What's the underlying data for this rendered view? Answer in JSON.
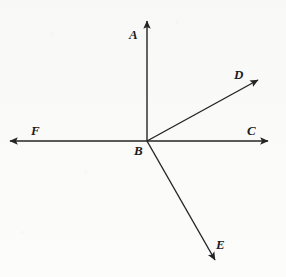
{
  "figure": {
    "kind": "ray-diagram",
    "caption": "",
    "stroke_color": "#242424",
    "label_color": "#1b1b1b",
    "background_color": "#fcfcfb",
    "stroke_width": 1.4,
    "width": 286,
    "height": 277
  },
  "chart_data": {
    "type": "diagram",
    "title": "",
    "subtitle": "",
    "xlabel": "",
    "ylabel": "",
    "vertex": {
      "label": "B",
      "x": 147,
      "y": 141
    },
    "rays": [
      {
        "label": "A",
        "from": [
          147,
          141
        ],
        "to": [
          147,
          21
        ],
        "direction": "up",
        "angle_deg": 90,
        "arrow": true
      },
      {
        "label": "D",
        "from": [
          147,
          141
        ],
        "to": [
          258,
          80
        ],
        "direction": "up-right",
        "angle_deg": 28.8,
        "arrow": true
      },
      {
        "label": "C",
        "from": [
          147,
          141
        ],
        "to": [
          268,
          141
        ],
        "direction": "right",
        "angle_deg": 0,
        "arrow": true
      },
      {
        "label": "E",
        "from": [
          147,
          141
        ],
        "to": [
          215,
          260
        ],
        "direction": "down-right",
        "angle_deg": -60.3,
        "arrow": true
      },
      {
        "label": "F",
        "from": [
          147,
          141
        ],
        "to": [
          10,
          141
        ],
        "direction": "left",
        "angle_deg": 180,
        "arrow": true
      }
    ],
    "labels": [
      {
        "text": "A",
        "x": 129,
        "y": 28
      },
      {
        "text": "D",
        "x": 234,
        "y": 68
      },
      {
        "text": "C",
        "x": 247,
        "y": 124
      },
      {
        "text": "F",
        "x": 31,
        "y": 124
      },
      {
        "text": "B",
        "x": 134,
        "y": 144
      },
      {
        "text": "E",
        "x": 216,
        "y": 238
      }
    ],
    "legend": [],
    "annotations": [],
    "grid": false
  }
}
